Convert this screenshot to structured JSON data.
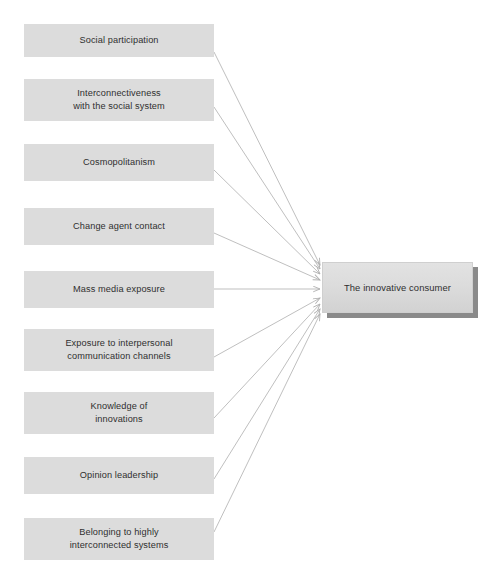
{
  "diagram": {
    "title": "",
    "background_color": "#ffffff",
    "source_box_color": "#dcdcdc",
    "target_box_color": "#dcdcdc",
    "shadow_color": "#8a8a8a",
    "connector_color": "#b4b4b4",
    "text_color": "#2f2f2f",
    "sources": [
      {
        "id": "social-participation",
        "label": "Social participation",
        "x": 24,
        "y": 24,
        "w": 190,
        "h": 33
      },
      {
        "id": "interconnectiveness-social-system",
        "label": "Interconnectiveness\nwith the social system",
        "x": 24,
        "y": 79,
        "w": 190,
        "h": 42
      },
      {
        "id": "cosmopolitanism",
        "label": "Cosmopolitanism",
        "x": 24,
        "y": 144,
        "w": 190,
        "h": 37
      },
      {
        "id": "change-agent-contact",
        "label": "Change agent contact",
        "x": 24,
        "y": 208,
        "w": 190,
        "h": 37
      },
      {
        "id": "mass-media-exposure",
        "label": "Mass media exposure",
        "x": 24,
        "y": 271,
        "w": 190,
        "h": 37
      },
      {
        "id": "exposure-interpersonal-communication",
        "label": "Exposure to interpersonal\ncommunication channels",
        "x": 24,
        "y": 329,
        "w": 190,
        "h": 42
      },
      {
        "id": "knowledge-of-innovations",
        "label": "Knowledge of\ninnovations",
        "x": 24,
        "y": 392,
        "w": 190,
        "h": 42
      },
      {
        "id": "opinion-leadership",
        "label": "Opinion leadership",
        "x": 24,
        "y": 457,
        "w": 190,
        "h": 37
      },
      {
        "id": "belonging-interconnected-systems",
        "label": "Belonging to highly\ninterconnected systems",
        "x": 24,
        "y": 518,
        "w": 190,
        "h": 42
      }
    ],
    "target": {
      "id": "innovative-consumer",
      "label": "The innovative consumer",
      "x": 322,
      "y": 262,
      "w": 151,
      "h": 51
    },
    "edges": [
      {
        "from": "social-participation",
        "to": "innovative-consumer",
        "x1": 214,
        "y1": 52,
        "x2": 320,
        "y2": 265
      },
      {
        "from": "interconnectiveness-social-system",
        "to": "innovative-consumer",
        "x1": 214,
        "y1": 107,
        "x2": 320,
        "y2": 269
      },
      {
        "from": "cosmopolitanism",
        "to": "innovative-consumer",
        "x1": 214,
        "y1": 170,
        "x2": 320,
        "y2": 274
      },
      {
        "from": "change-agent-contact",
        "to": "innovative-consumer",
        "x1": 214,
        "y1": 233,
        "x2": 320,
        "y2": 280
      },
      {
        "from": "mass-media-exposure",
        "to": "innovative-consumer",
        "x1": 214,
        "y1": 289,
        "x2": 320,
        "y2": 289
      },
      {
        "from": "exposure-interpersonal-communication",
        "to": "innovative-consumer",
        "x1": 214,
        "y1": 357,
        "x2": 320,
        "y2": 298
      },
      {
        "from": "knowledge-of-innovations",
        "to": "innovative-consumer",
        "x1": 214,
        "y1": 418,
        "x2": 320,
        "y2": 304
      },
      {
        "from": "opinion-leadership",
        "to": "innovative-consumer",
        "x1": 214,
        "y1": 479,
        "x2": 320,
        "y2": 309
      },
      {
        "from": "belonging-interconnected-systems",
        "to": "innovative-consumer",
        "x1": 214,
        "y1": 532,
        "x2": 320,
        "y2": 314
      }
    ]
  }
}
